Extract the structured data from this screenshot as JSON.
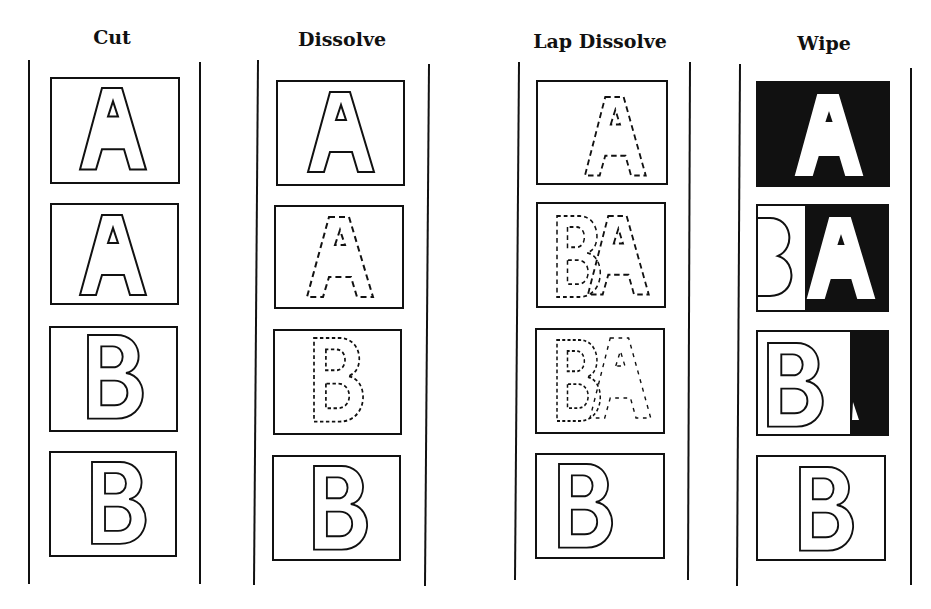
{
  "columns": [
    {
      "title": "Cut",
      "frames": [
        "A",
        "A",
        "B",
        "B"
      ]
    },
    {
      "title": "Dissolve",
      "frames": [
        "A (solid)",
        "A (dashed)",
        "B (dashed)",
        "B (solid)"
      ]
    },
    {
      "title": "Lap Dissolve",
      "frames": [
        "A (dashed)",
        "B + A overlap (dashed)",
        "B + A overlap (dashed)",
        "B (solid)"
      ]
    },
    {
      "title": "Wipe",
      "frames": [
        "A on black",
        "B | A wipe",
        "B | A wipe",
        "B"
      ]
    }
  ],
  "colors": {
    "ink": "#111111",
    "paper": "#ffffff"
  }
}
